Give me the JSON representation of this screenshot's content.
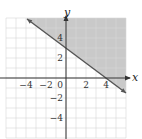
{
  "chart_data": {
    "type": "line",
    "subtype": "linear-inequality-graph",
    "title": "",
    "xlabel": "x",
    "ylabel": "y",
    "xlim": [
      -6,
      6
    ],
    "ylim": [
      -6,
      6
    ],
    "grid": true,
    "grid_step": 1,
    "x_tick_labels": [
      {
        "value": -4,
        "label": "−4"
      },
      {
        "value": -2,
        "label": "−2"
      },
      {
        "value": 0,
        "label": "0"
      },
      {
        "value": 2,
        "label": "2"
      },
      {
        "value": 4,
        "label": "4"
      }
    ],
    "y_tick_labels": [
      {
        "value": 4,
        "label": "4"
      },
      {
        "value": 2,
        "label": "2"
      },
      {
        "value": -2,
        "label": "−2"
      },
      {
        "value": -4,
        "label": "−4"
      }
    ],
    "boundary_line": {
      "equation": "y = -3/4 x + 3",
      "slope": -0.75,
      "intercept": 3,
      "points": [
        [
          0,
          3
        ],
        [
          4,
          0
        ]
      ],
      "style": "solid",
      "drawn_from": [
        -3.9,
        5.9
      ],
      "drawn_to": [
        6,
        -1.5
      ],
      "arrows": true
    },
    "shaded_region": "above the line (y >= -3/4 x + 3)",
    "inequality": "3x + 4y >= 12"
  },
  "colors": {
    "shade": "#c9c9c9",
    "grid": "#d6d6d6",
    "axis": "#333333",
    "line": "#555555"
  }
}
